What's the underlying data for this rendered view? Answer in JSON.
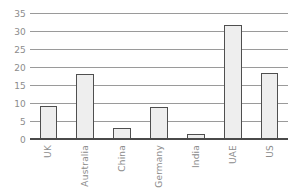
{
  "chart_data": {
    "type": "bar",
    "title": "",
    "subtitle": "",
    "xlabel": "",
    "ylabel": "",
    "categories": [
      "UK",
      "Australia",
      "China",
      "Germany",
      "India",
      "UAE",
      "US"
    ],
    "values": [
      9.5,
      18.3,
      3.2,
      9.3,
      1.8,
      32.0,
      18.6
    ],
    "series": [
      {
        "name": "",
        "values": [
          9.5,
          18.3,
          3.2,
          9.3,
          1.8,
          32.0,
          18.6
        ]
      }
    ],
    "ylim": [
      0,
      35
    ],
    "yticks": [
      0,
      5,
      10,
      15,
      20,
      25,
      30,
      35
    ],
    "ytick_labels": [
      "0",
      "5",
      "10",
      "15",
      "20",
      "25",
      "30",
      "35"
    ],
    "grid": true,
    "grid_axis": "y",
    "legend": false,
    "legend_position": "none",
    "annotations": [],
    "bar_fill_color": "#eeeeee",
    "bar_edge_color": "#4f4f4f",
    "grid_color": "#9a9a9a",
    "axis_color": "#4a4a4a",
    "tick_label_color": "#8c8c8c",
    "background_color": "#ffffff"
  }
}
